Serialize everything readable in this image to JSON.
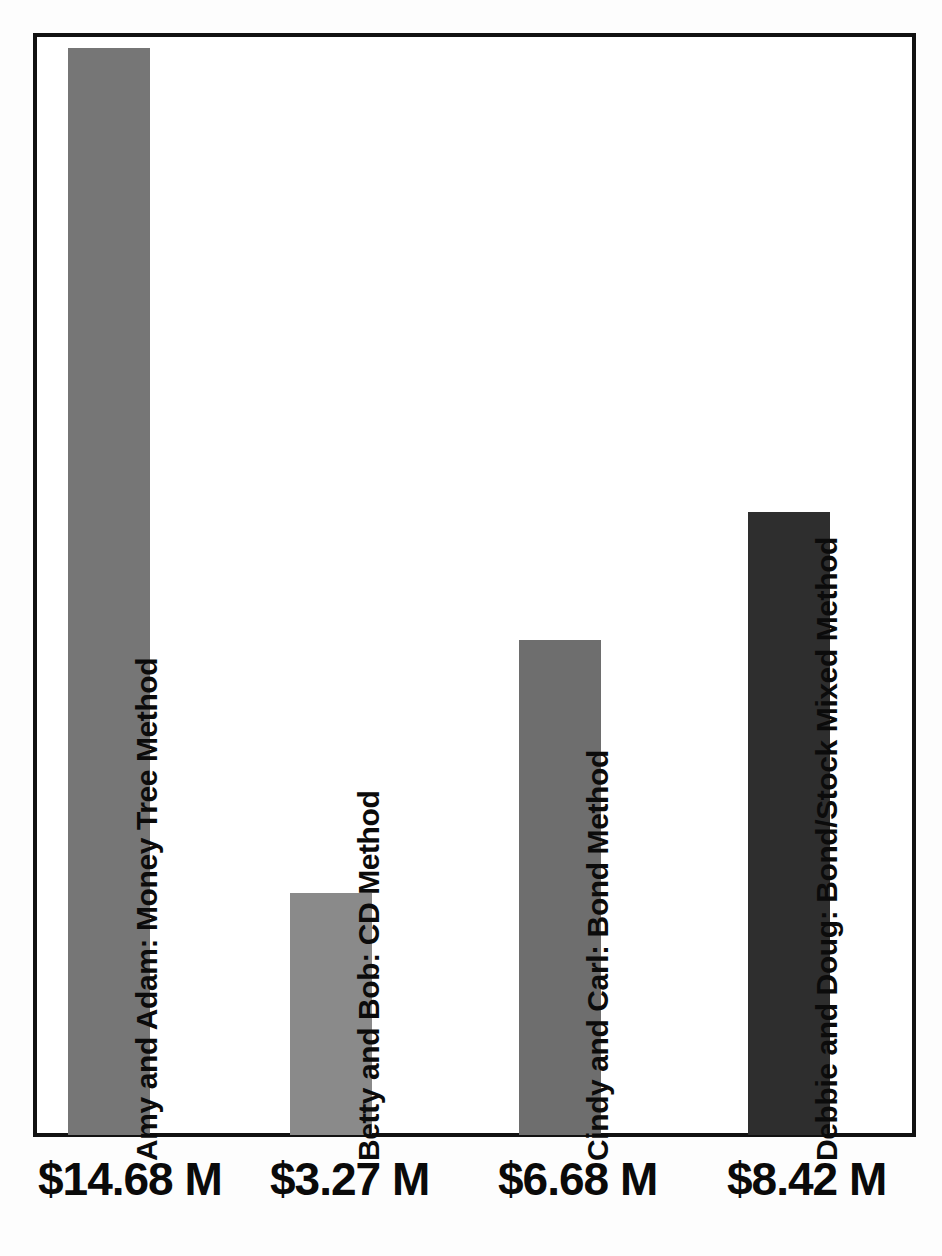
{
  "chart_data": {
    "type": "bar",
    "title": "",
    "subtitle": "",
    "xlabel": "",
    "ylabel": "",
    "grid": false,
    "legend": "none",
    "orientation": "vertical",
    "ylim": [
      0,
      15.3
    ],
    "categories": [
      "Amy and Adam: Money Tree Method",
      "Betty and Bob: CD Method",
      "Cindy and Carl: Bond Method",
      "Debbie and Doug: Bond/Stock Mixed Method"
    ],
    "values": [
      14.68,
      3.27,
      6.68,
      8.42
    ],
    "value_labels": [
      "$14.68 M",
      "$3.27 M",
      "$6.68 M",
      "$8.42 M"
    ],
    "units": "millions of dollars",
    "bar_colors": [
      "#767676",
      "#8a8a8a",
      "#6e6e6e",
      "#2e2e2e"
    ],
    "annotations": []
  },
  "frame": {
    "border_color": "#111111",
    "background_color": "#ffffff"
  },
  "bars": [
    {
      "category": "Amy and Adam: Money Tree Method",
      "label": "Amy and Adam: Money Tree Method",
      "value": 14.68,
      "value_label": "$14.68 M",
      "color": "#767676"
    },
    {
      "category": "Betty and Bob: CD Method",
      "label": "Betty and Bob: CD Method",
      "value": 3.27,
      "value_label": "$3.27 M",
      "color": "#8a8a8a"
    },
    {
      "category": "Cindy and Carl: Bond Method",
      "label": "Cindy and Carl: Bond Method",
      "value": 6.68,
      "value_label": "$6.68 M",
      "color": "#6e6e6e"
    },
    {
      "category": "Debbie and Doug: Bond/Stock Mixed Method",
      "label": "Debbie and Doug: Bond/Stock Mixed Method",
      "value": 8.42,
      "value_label": "$8.42 M",
      "color": "#2e2e2e"
    }
  ]
}
